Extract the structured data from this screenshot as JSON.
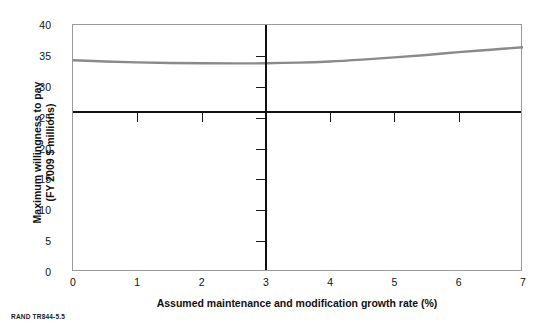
{
  "chart_data": {
    "type": "line",
    "title": "",
    "xlabel": "Assumed maintenance and modification growth rate (%)",
    "ylabel": "Maximum willingness to pay\n(FY 2009 $ millions)",
    "xlim": [
      0,
      7
    ],
    "ylim": [
      0,
      40
    ],
    "xticks": [
      0,
      1,
      2,
      3,
      4,
      5,
      6,
      7
    ],
    "yticks": [
      0,
      5,
      10,
      15,
      20,
      25,
      30,
      35,
      40
    ],
    "grid": false,
    "legend": "none",
    "series": [
      {
        "name": "Maximum willingness to pay",
        "color": "#8a8a8a",
        "x": [
          0,
          0.5,
          1,
          1.5,
          2,
          2.5,
          3,
          3.5,
          4,
          4.5,
          5,
          5.5,
          6,
          6.5,
          7
        ],
        "values": [
          34.3,
          34.1,
          33.95,
          33.85,
          33.8,
          33.78,
          33.8,
          33.9,
          34.1,
          34.4,
          34.75,
          35.15,
          35.6,
          36.0,
          36.4
        ]
      }
    ],
    "reference_lines": [
      {
        "name": "baseline-willingness-to-pay",
        "orientation": "horizontal",
        "value": 26,
        "color": "#111111"
      },
      {
        "name": "baseline-growth-rate",
        "orientation": "vertical",
        "value": 3,
        "color": "#111111"
      }
    ]
  },
  "caption": "RAND TR844-5.5"
}
